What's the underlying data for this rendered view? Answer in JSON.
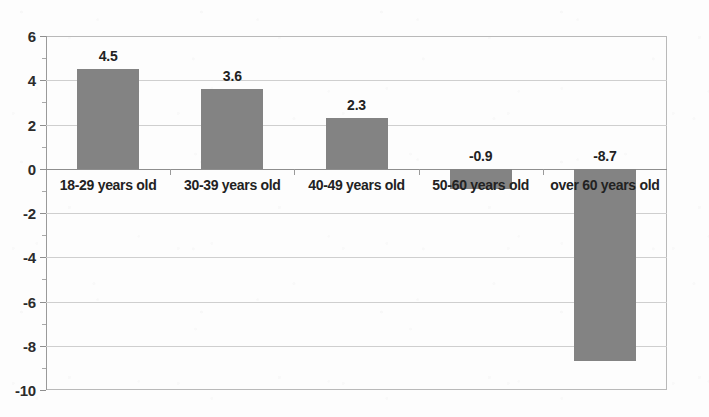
{
  "chart_data": {
    "type": "bar",
    "title": "",
    "subtitle": "",
    "xlabel": "",
    "ylabel": "",
    "categories": [
      "18-29 years old",
      "30-39 years old",
      "40-49 years old",
      "50-60 years old",
      "over 60 years old"
    ],
    "values": [
      4.5,
      3.6,
      2.3,
      -0.9,
      -8.7
    ],
    "value_labels": [
      "4.5",
      "3.6",
      "2.3",
      "-0.9",
      "-8.7"
    ],
    "ylim": [
      -10,
      6
    ],
    "ytick_values": [
      6,
      4,
      2,
      0,
      -2,
      -4,
      -6,
      -8,
      -10
    ],
    "ytick_labels": [
      "6",
      "4",
      "2",
      "0",
      "-2",
      "-4",
      "-6",
      "-8",
      "-10"
    ],
    "yminor_tick_values": [
      5,
      3,
      1,
      -1,
      -3,
      -5,
      -7,
      -9
    ],
    "grid": true,
    "grid_axis": "y",
    "legend": false,
    "legend_position": "none",
    "bar_color": "#838383",
    "gridline_color": "#cfcfcf",
    "axis_color": "#8e8e8e",
    "background_color": "#fdfdfd",
    "text_color": "#222222"
  }
}
